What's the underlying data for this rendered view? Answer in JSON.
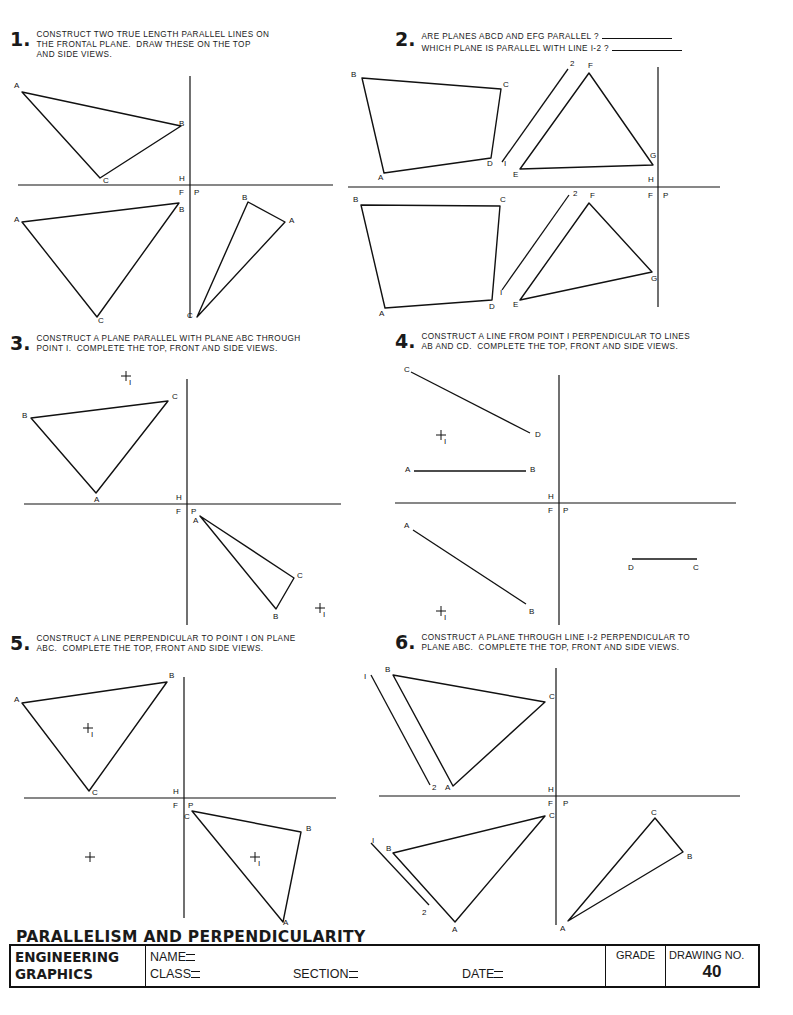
{
  "problems": [
    {
      "number": "1.",
      "lines": [
        "CONSTRUCT TWO TRUE LENGTH PARALLEL LINES ON",
        "THE FRONTAL PLANE.  DRAW THESE ON THE TOP",
        "AND SIDE VIEWS."
      ]
    },
    {
      "number": "2.",
      "lines": [
        "ARE PLANES ABCD AND EFG PARALLEL ?",
        "WHICH PLANE IS PARALLEL WITH LINE I-2 ?"
      ]
    },
    {
      "number": "3.",
      "lines": [
        "CONSTRUCT A PLANE PARALLEL WITH PLANE ABC THROUGH",
        "POINT I.  COMPLETE THE TOP, FRONT AND SIDE VIEWS."
      ]
    },
    {
      "number": "4.",
      "lines": [
        "CONSTRUCT A LINE FROM POINT I PERPENDICULAR TO LINES",
        "AB AND CD.  COMPLETE THE TOP, FRONT AND SIDE VIEWS."
      ]
    },
    {
      "number": "5.",
      "lines": [
        "CONSTRUCT A LINE PERPENDICULAR TO POINT I ON PLANE",
        "ABC.  COMPLETE THE TOP, FRONT AND SIDE VIEWS."
      ]
    },
    {
      "number": "6.",
      "lines": [
        "CONSTRUCT A PLANE THROUGH LINE I-2 PERPENDICULAR TO",
        "PLANE ABC.  COMPLETE THE TOP, FRONT AND SIDE VIEWS."
      ]
    }
  ],
  "fold_labels": {
    "h": "H",
    "f": "F",
    "p": "P"
  },
  "drawings": {
    "p1": {
      "axes": {
        "hx1": 18,
        "hx2": 333,
        "hy": 185,
        "vx": 190,
        "vy1": 76,
        "vy2": 318
      },
      "polys": [
        {
          "pts": [
            [
              22,
              92
            ],
            [
              181,
              126
            ],
            [
              100,
              178
            ]
          ],
          "labels": [
            [
              "A",
              14,
              88
            ],
            [
              "B",
              179,
              126
            ],
            [
              "C",
              103,
              183
            ]
          ]
        },
        {
          "pts": [
            [
              22,
              222
            ],
            [
              179,
              203
            ],
            [
              97,
              317
            ]
          ],
          "labels": [
            [
              "A",
              14,
              222
            ],
            [
              "B",
              179,
              212
            ],
            [
              "C",
              98,
              323
            ]
          ]
        },
        {
          "pts": [
            [
              248,
              202
            ],
            [
              285,
              222
            ],
            [
              197,
              317
            ]
          ],
          "labels": [
            [
              "B",
              242,
              200
            ],
            [
              "A",
              289,
              223
            ],
            [
              "C",
              187,
              318
            ]
          ]
        }
      ]
    },
    "p2": {
      "axes": {
        "hx1": 348,
        "hx2": 720,
        "hy": 187,
        "vx": 658,
        "vy1": 67,
        "vy2": 307
      },
      "polys": [
        {
          "pts": [
            [
              362,
              78
            ],
            [
              501,
              89
            ],
            [
              491,
              158
            ],
            [
              384,
              173
            ]
          ],
          "labels": [
            [
              "B",
              351,
              77
            ],
            [
              "C",
              503,
              87
            ],
            [
              "D",
              487,
              166
            ],
            [
              "A",
              378,
              180
            ]
          ]
        },
        {
          "pts": [
            [
              589,
              73
            ],
            [
              653,
              165
            ],
            [
              520,
              169
            ]
          ],
          "labels": [
            [
              "F",
              588,
              68
            ],
            [
              "G",
              650,
              158
            ],
            [
              "E",
              513,
              177
            ]
          ]
        },
        {
          "pts": [
            [
              361,
              205
            ],
            [
              500,
              206
            ],
            [
              492,
              300
            ],
            [
              385,
              308
            ]
          ],
          "labels": [
            [
              "B",
              353,
              202
            ],
            [
              "C",
              500,
              202
            ],
            [
              "D",
              489,
              309
            ],
            [
              "A",
              379,
              316
            ]
          ]
        },
        {
          "pts": [
            [
              589,
              203
            ],
            [
              652,
              272
            ],
            [
              520,
              300
            ]
          ],
          "labels": [
            [
              "F",
              590,
              198
            ],
            [
              "G",
              651,
              281
            ],
            [
              "E",
              513,
              307
            ]
          ]
        }
      ],
      "lines": [
        [
          502,
          162,
          568,
          69
        ],
        [
          502,
          290,
          569,
          195
        ]
      ],
      "labels": [
        [
          "I",
          504,
          166
        ],
        [
          "2",
          570,
          66
        ],
        [
          "I",
          500,
          295
        ],
        [
          "2",
          573,
          196
        ],
        [
          "H",
          648,
          182
        ],
        [
          "F",
          648,
          198
        ],
        [
          "P",
          663,
          198
        ]
      ]
    },
    "p3": {
      "axes": {
        "hx1": 24,
        "hx2": 341,
        "hy": 504,
        "vx": 187,
        "vy1": 379,
        "vy2": 625
      },
      "polys": [
        {
          "pts": [
            [
              31,
              418
            ],
            [
              168,
              401
            ],
            [
              96,
              493
            ]
          ],
          "labels": [
            [
              "B",
              22,
              418
            ],
            [
              "C",
              172,
              399
            ],
            [
              "A",
              94,
              502
            ]
          ]
        },
        {
          "pts": [
            [
              200,
              516
            ],
            [
              294,
              578
            ],
            [
              276,
              609
            ]
          ],
          "labels": [
            [
              "A",
              193,
              523
            ],
            [
              "C",
              297,
              578
            ],
            [
              "B",
              273,
              619
            ]
          ]
        }
      ],
      "crosses": [
        [
          126,
          376,
          "I"
        ],
        [
          320,
          608,
          "I"
        ]
      ]
    },
    "p4": {
      "axes": {
        "hx1": 395,
        "hx2": 736,
        "hy": 503,
        "vx": 559,
        "vy1": 375,
        "vy2": 625
      },
      "lines": [
        [
          411,
          372,
          530,
          433
        ],
        [
          414,
          471,
          526,
          471
        ],
        [
          413,
          530,
          526,
          604
        ],
        [
          632,
          559,
          697,
          559
        ]
      ],
      "labels": [
        [
          "C",
          404,
          372
        ],
        [
          "D",
          535,
          437
        ],
        [
          "A",
          405,
          472
        ],
        [
          "B",
          530,
          472
        ],
        [
          "A",
          404,
          528
        ],
        [
          "B",
          529,
          614
        ],
        [
          "D",
          628,
          570
        ],
        [
          "C",
          693,
          570
        ]
      ],
      "crosses": [
        [
          441,
          435,
          "I"
        ],
        [
          441,
          611,
          "I"
        ]
      ]
    },
    "p5": {
      "axes": {
        "hx1": 24,
        "hx2": 336,
        "hy": 798,
        "vx": 184,
        "vy1": 677,
        "vy2": 918
      },
      "polys": [
        {
          "pts": [
            [
              22,
              703
            ],
            [
              167,
              682
            ],
            [
              89,
              791
            ]
          ],
          "labels": [
            [
              "A",
              14,
              702
            ],
            [
              "B",
              169,
              678
            ],
            [
              "C",
              92,
              795
            ]
          ]
        },
        {
          "pts": [
            [
              192,
              811
            ],
            [
              301,
              832
            ],
            [
              283,
              922
            ]
          ],
          "labels": [
            [
              "C",
              184,
              819
            ],
            [
              "B",
              306,
              831
            ],
            [
              "A",
              283,
              925
            ]
          ]
        }
      ],
      "crosses": [
        [
          88,
          728,
          "I"
        ],
        [
          90,
          857,
          ""
        ],
        [
          255,
          857,
          "I"
        ]
      ]
    },
    "p6": {
      "axes": {
        "hx1": 379,
        "hx2": 740,
        "hy": 796,
        "vx": 556,
        "vy1": 668,
        "vy2": 925
      },
      "polys": [
        {
          "pts": [
            [
              393,
              675
            ],
            [
              545,
              702
            ],
            [
              453,
              786
            ]
          ],
          "labels": [
            [
              "B",
              385,
              672
            ],
            [
              "C",
              549,
              699
            ],
            [
              "A",
              445,
              790
            ]
          ]
        },
        {
          "pts": [
            [
              393,
              853
            ],
            [
              545,
              816
            ],
            [
              455,
              922
            ]
          ],
          "labels": [
            [
              "B",
              386,
              851
            ],
            [
              "C",
              549,
              818
            ],
            [
              "A",
              452,
              932
            ]
          ]
        },
        {
          "pts": [
            [
              655,
              818
            ],
            [
              683,
              852
            ],
            [
              568,
              921
            ]
          ],
          "labels": [
            [
              "C",
              651,
              815
            ],
            [
              "B",
              687,
              859
            ],
            [
              "A",
              560,
              931
            ]
          ]
        }
      ],
      "lines": [
        [
          371,
          675,
          430,
          785
        ],
        [
          371,
          843,
          429,
          905
        ]
      ],
      "labels": [
        [
          "I",
          364,
          679
        ],
        [
          "2",
          432,
          790
        ],
        [
          "I",
          372,
          843
        ],
        [
          "2",
          422,
          915
        ],
        [
          "H",
          548,
          792
        ],
        [
          "F",
          548,
          806
        ],
        [
          "P",
          563,
          806
        ]
      ]
    }
  },
  "footer": {
    "title": "PARALLELISM AND PERPENDICULARITY",
    "course_line1": "ENGINEERING",
    "course_line2": "GRAPHICS",
    "name_label": "NAME",
    "class_label": "CLASS",
    "section_label": "SECTION",
    "date_label": "DATE",
    "grade_label": "GRADE",
    "drawing_no_label": "DRAWING NO.",
    "drawing_no": "40"
  }
}
